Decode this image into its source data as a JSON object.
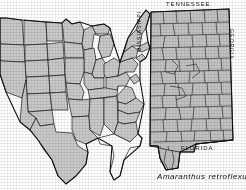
{
  "figure": {
    "name": "species-distribution-figure",
    "caption": "Amaranthus retroflexus",
    "background_color": "#ffffff",
    "ink_color": "#171717",
    "shaded_fill": "#c9c9c9",
    "unshaded_fill": "#ffffff"
  },
  "us_map": {
    "name": "united-states-distribution-map",
    "description": "Outline map of the conterminous United States with states shaded to show species occurrence",
    "legend": {
      "shaded_meaning": "species present",
      "unshaded_meaning": "species not recorded"
    },
    "shaded_states": [
      "Washington",
      "Oregon",
      "Idaho",
      "Montana",
      "North Dakota",
      "Minnesota",
      "Wisconsin",
      "Michigan",
      "South Dakota",
      "Wyoming",
      "Nebraska",
      "Iowa",
      "Illinois",
      "Indiana",
      "Ohio",
      "Pennsylvania",
      "New York",
      "Vermont",
      "New Hampshire",
      "Maine",
      "Massachusetts",
      "Connecticut",
      "Rhode Island",
      "New Jersey",
      "Delaware",
      "Maryland",
      "West Virginia",
      "Virginia",
      "Kentucky",
      "Missouri",
      "Kansas",
      "Colorado",
      "Utah",
      "Nevada",
      "California",
      "Arizona",
      "New Mexico",
      "Oklahoma",
      "Texas",
      "Arkansas",
      "Louisiana",
      "Mississippi",
      "Alabama",
      "Tennessee",
      "North Carolina",
      "South Carolina",
      "Georgia"
    ],
    "unshaded_states": [
      "Florida"
    ]
  },
  "alabama_map": {
    "name": "alabama-county-map",
    "description": "County map of Alabama with all counties shaded, indicating statewide occurrence",
    "county_count": 67,
    "all_counties_shaded": true,
    "neighbor_labels": {
      "north": "TENNESSEE",
      "west": "MISSISSIPPI",
      "east": "GEORGIA",
      "south": "FLORIDA"
    }
  }
}
